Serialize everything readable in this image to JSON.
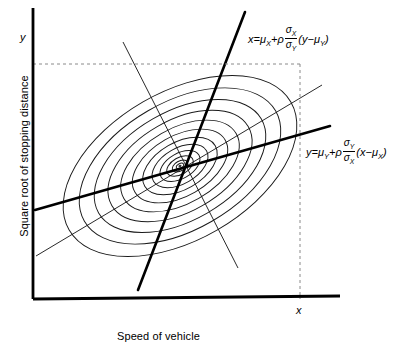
{
  "chart_data": {
    "type": "scatter",
    "title": "",
    "xlabel": "Speed of vehicle",
    "ylabel": "Square root of stopping distance",
    "axis_tick_x": "x",
    "axis_tick_y": "y",
    "grid": false,
    "legend": "none",
    "contours": {
      "shape": "ellipse",
      "count": 13,
      "center": [
        180,
        166
      ],
      "rotation_deg": -30,
      "outer_semi_major": 128,
      "outer_semi_minor": 74,
      "spacing": "geometric, tightening toward centre"
    },
    "lines": [
      {
        "name": "regression-of-y-on-x",
        "style": "bold",
        "from": [
          35,
          210
        ],
        "to": [
          330,
          126
        ],
        "equation": "y = μ_Y + ρ (σ_Y/σ_X)(x − μ_X)"
      },
      {
        "name": "regression-of-x-on-y",
        "style": "bold",
        "from": [
          245,
          12
        ],
        "to": [
          138,
          290
        ],
        "equation": "x = μ_X + ρ (σ_X/σ_Y)(y − μ_Y)"
      },
      {
        "name": "principal-axis-major",
        "style": "thin",
        "from": [
          36,
          256
        ],
        "to": [
          322,
          85
        ]
      },
      {
        "name": "principal-axis-minor",
        "style": "thin",
        "from": [
          123,
          42
        ],
        "to": [
          238,
          268
        ]
      }
    ],
    "dashed_guides": [
      {
        "name": "horizontal-tangent",
        "from": [
          33,
          64
        ],
        "to": [
          300,
          64
        ]
      },
      {
        "name": "vertical-tangent",
        "from": [
          300,
          64
        ],
        "to": [
          300,
          299
        ]
      }
    ],
    "axes": {
      "x_axis": {
        "from": [
          33,
          299
        ],
        "to": [
          340,
          296
        ]
      },
      "y_axis": {
        "from": [
          33,
          8
        ],
        "to": [
          33,
          299
        ]
      }
    }
  },
  "labels": {
    "y_axis_title": "Square root of stopping distance",
    "x_axis_title": "Speed of vehicle",
    "y_tick": "y",
    "x_tick": "x"
  },
  "equations": {
    "x_on_y": {
      "lhs": "x",
      "eq": "=",
      "mu": "μ",
      "mu_sub": "X",
      "plus": "+",
      "rho": "ρ",
      "num": "σ",
      "num_sub": "X",
      "den": "σ",
      "den_sub": "Y",
      "tail_open": "(",
      "tail_var": "y",
      "minus": "−",
      "tail_mu": "μ",
      "tail_mu_sub": "Y",
      "tail_close": ")"
    },
    "y_on_x": {
      "lhs": "y",
      "eq": "=",
      "mu": "μ",
      "mu_sub": "Y",
      "plus": "+",
      "rho": "ρ",
      "num": "σ",
      "num_sub": "Y",
      "den": "σ",
      "den_sub": "X",
      "tail_open": "(",
      "tail_var": "x",
      "minus": "−",
      "tail_mu": "μ",
      "tail_mu_sub": "X",
      "tail_close": ")"
    }
  },
  "colors": {
    "ink": "#000000",
    "contour": "#1a1a1a",
    "dashed": "#8a8a8a",
    "background": "#ffffff"
  }
}
